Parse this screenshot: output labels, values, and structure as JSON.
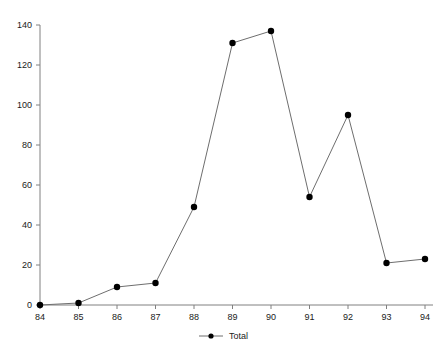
{
  "chart_data": {
    "type": "line",
    "title": "",
    "subtitle": "",
    "xlabel": "",
    "ylabel": "",
    "categories": [
      "84",
      "85",
      "86",
      "87",
      "88",
      "89",
      "90",
      "91",
      "92",
      "93",
      "94"
    ],
    "x": [
      84,
      85,
      86,
      87,
      88,
      89,
      90,
      91,
      92,
      93,
      94
    ],
    "series": [
      {
        "name": "Total",
        "values": [
          0,
          1,
          9,
          11,
          49,
          131,
          137,
          54,
          95,
          21,
          23
        ]
      }
    ],
    "xlim": [
      84,
      94
    ],
    "ylim": [
      0,
      140
    ],
    "xticks": [
      "84",
      "85",
      "86",
      "87",
      "88",
      "89",
      "90",
      "91",
      "92",
      "93",
      "94"
    ],
    "yticks": [
      "0",
      "20",
      "40",
      "60",
      "80",
      "100",
      "120",
      "140"
    ],
    "ytick_values": [
      0,
      20,
      40,
      60,
      80,
      100,
      120,
      140
    ],
    "grid": false,
    "legend": {
      "position": "bottom-center",
      "entries": [
        {
          "label": "Total",
          "marker": "filled-circle",
          "line": "solid"
        }
      ]
    },
    "colors": {
      "line": "#6e6e6e",
      "marker": "#000000",
      "axis": "#808080",
      "text": "#1a1a1a",
      "background": "#ffffff"
    },
    "marker_style": "filled-circle",
    "line_width": 1
  }
}
